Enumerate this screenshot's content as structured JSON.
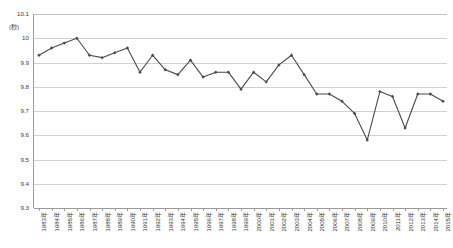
{
  "chart_data": {
    "type": "line",
    "title": "",
    "xlabel": "",
    "ylabel": "(秒)",
    "yunit": "(秒)",
    "ylim": [
      9.3,
      10.1
    ],
    "ytick_values": [
      10.1,
      10,
      9.9,
      9.8,
      9.7,
      9.6,
      9.5,
      9.4,
      9.3
    ],
    "ytick_labels": [
      "10.1",
      "10",
      "9.9",
      "9.8",
      "9.7",
      "9.6",
      "9.5",
      "9.4",
      "9.3"
    ],
    "grid": true,
    "legend": "none",
    "categories": [
      "1983年",
      "1984年",
      "1985年",
      "1986年",
      "1987年",
      "1988年",
      "1989年",
      "1990年",
      "1991年",
      "1992年",
      "1993年",
      "1994年",
      "1995年",
      "1996年",
      "1997年",
      "1998年",
      "1999年",
      "2000年",
      "2001年",
      "2002年",
      "2003年",
      "2004年",
      "2005年",
      "2006年",
      "2007年",
      "2008年",
      "2009年",
      "2010年",
      "2011年",
      "2012年",
      "2013年",
      "2014年",
      "2015年"
    ],
    "values": [
      9.93,
      9.96,
      9.98,
      10.0,
      9.93,
      9.92,
      9.94,
      9.96,
      9.86,
      9.93,
      9.87,
      9.85,
      9.91,
      9.84,
      9.86,
      9.86,
      9.79,
      9.86,
      9.82,
      9.89,
      9.93,
      9.85,
      9.77,
      9.77,
      9.74,
      9.69,
      9.58,
      9.78,
      9.76,
      9.63,
      9.77,
      9.77,
      9.74
    ],
    "series": [
      {
        "name": "",
        "values": [
          9.93,
          9.96,
          9.98,
          10.0,
          9.93,
          9.92,
          9.94,
          9.96,
          9.86,
          9.93,
          9.87,
          9.85,
          9.91,
          9.84,
          9.86,
          9.86,
          9.79,
          9.86,
          9.82,
          9.89,
          9.93,
          9.85,
          9.77,
          9.77,
          9.74,
          9.69,
          9.58,
          9.78,
          9.76,
          9.63,
          9.77,
          9.77,
          9.74
        ]
      }
    ],
    "line_color": "#4a4a4a",
    "marker": "diamond"
  }
}
